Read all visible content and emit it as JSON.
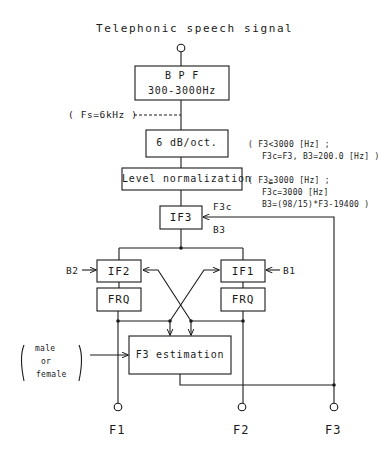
{
  "diagram": {
    "title": "Telephonic speech signal",
    "blocks": {
      "bpf": {
        "line1": "B P F",
        "line2": "300-3000Hz"
      },
      "preemphasis": {
        "label": "6 dB/oct."
      },
      "level_norm": {
        "label": "Level normalization"
      },
      "if3": {
        "label": "IF3"
      },
      "if2": {
        "label": "IF2"
      },
      "if1": {
        "label": "IF1"
      },
      "frq_left": {
        "label": "FRQ"
      },
      "frq_right": {
        "label": "FRQ"
      },
      "f3_estimation": {
        "label": "F3 estimation"
      }
    },
    "annotations": {
      "sampling": "( Fs=6kHz )",
      "rule1_line1": "( F3<3000 [Hz] ;",
      "rule1_line2": "F3c=F3, B3=200.0 [Hz] )",
      "rule2_line1": "( F3≧3000 [Hz] ;",
      "rule2_line2": "F3c=3000 [Hz]",
      "rule2_line3": "B3=(98/15)*F3-19400 )",
      "f3c": "F3c",
      "b3": "B3",
      "b2": "B2",
      "b1": "B1",
      "gender_line1": "male",
      "gender_line2": "or",
      "gender_line3": "female"
    },
    "outputs": {
      "f1": "F1",
      "f2": "F2",
      "f3": "F3"
    },
    "colors": {
      "line": "#1a1a1a",
      "background": "#ffffff"
    }
  }
}
